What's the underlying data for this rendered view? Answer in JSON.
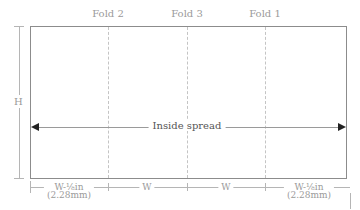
{
  "diagram": {
    "folds": [
      {
        "label": "Fold 2",
        "x": 108
      },
      {
        "label": "Fold 3",
        "x": 187
      },
      {
        "label": "Fold 1",
        "x": 265
      }
    ],
    "height_label": "H",
    "spread_label": "Inside spread",
    "dimensions": [
      {
        "line1": "W-⅛in",
        "line2": "(2.28mm)"
      },
      {
        "label": "W"
      },
      {
        "label": "W"
      },
      {
        "line1": "W-⅛in",
        "line2": "(2.28mm)"
      }
    ],
    "colors": {
      "panel_border": "#8c8c8c",
      "fold_line": "#c4c4c4",
      "dimension_line": "#b5b5b5",
      "arrow": "#222222",
      "text": "#9a9a9a"
    }
  }
}
